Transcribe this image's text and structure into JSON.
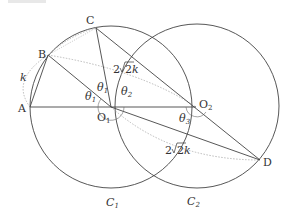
{
  "figure": {
    "type": "geometry-diagram",
    "circles": [
      {
        "name": "C1",
        "label": "C",
        "sub": "1",
        "center": "O1"
      },
      {
        "name": "C2",
        "label": "C",
        "sub": "2",
        "center": "O2"
      }
    ],
    "points": {
      "A": "A",
      "B": "B",
      "C": "C",
      "D": "D",
      "O1": {
        "main": "O",
        "sub": "1"
      },
      "O2": {
        "main": "O",
        "sub": "2"
      }
    },
    "angles": {
      "theta1_a": {
        "main": "θ",
        "sub": "1"
      },
      "theta1_b": {
        "main": "θ",
        "sub": "1"
      },
      "theta2": {
        "main": "θ",
        "sub": "2"
      },
      "theta3": {
        "main": "θ",
        "sub": "3"
      }
    },
    "lengths": {
      "k": "k",
      "upper": {
        "coef": "2",
        "root": "2",
        "var": "k"
      },
      "lower": {
        "coef": "2",
        "root": "2",
        "var": "k"
      }
    }
  },
  "colors": {
    "line": "#444444",
    "dotted": "#aaaaaa",
    "text": "#333333"
  }
}
